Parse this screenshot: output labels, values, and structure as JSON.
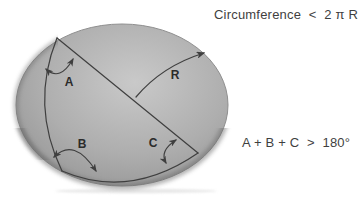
{
  "formulas": {
    "circumference": "Circumference  <  2 π R",
    "angle_sum": "A + B + C  >  180°"
  },
  "sphere": {
    "labels": {
      "angle_a": "A",
      "angle_b": "B",
      "angle_c": "C",
      "radius": "R"
    }
  },
  "colors": {
    "background": "#ffffff",
    "sphere_light": "#c9c9c9",
    "sphere_mid": "#aeaeae",
    "sphere_edge": "#8f8f8f",
    "sphere_rim_shadow": "#6c6c6c",
    "line": "#3f3f3f",
    "label_text": "#2b2b2b",
    "formula_text": "#3f3f3f",
    "ground_shadow": "#d9d9d9"
  }
}
